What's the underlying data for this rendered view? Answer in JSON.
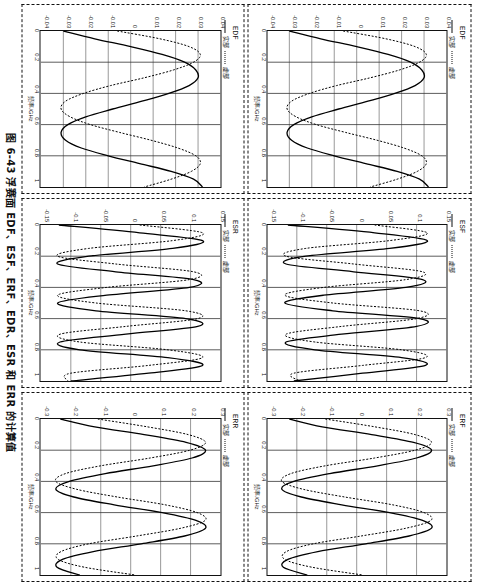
{
  "figure": {
    "caption": "图 6-43  浮赛面 EDF、ESF、ERF、EDR、ESR 和 ERR 的计算值"
  },
  "legend": {
    "real_label": "实部",
    "imag_label": "虚部"
  },
  "axis": {
    "xlabel": "频率/GHz",
    "xticks": [
      "0",
      "0.2",
      "0.4",
      "0.6",
      "0.8",
      "1"
    ]
  },
  "chart_data": [
    {
      "id": "edf",
      "type": "line",
      "title": "EDF",
      "xlabel": "频率/GHz",
      "ylabel": "",
      "xlim": [
        0,
        1
      ],
      "ylim": [
        -0.04,
        0.04
      ],
      "xticks": [
        "0",
        "0.2",
        "0.4",
        "0.6",
        "0.8",
        "1"
      ],
      "yticks": [
        "0.04",
        "0.03",
        "0.02",
        "0.01",
        "0",
        "-0.01",
        "-0.02",
        "-0.03",
        "-0.04"
      ],
      "grid": true,
      "legend_position": "top-left",
      "series": [
        {
          "name": "实部",
          "style": "solid",
          "x": [
            0,
            0.05,
            0.1,
            0.15,
            0.2,
            0.25,
            0.3,
            0.35,
            0.4,
            0.45,
            0.5,
            0.55,
            0.6,
            0.65,
            0.7,
            0.75,
            0.8,
            0.85,
            0.9,
            0.95,
            1
          ],
          "values": [
            -0.03,
            -0.016,
            0.0,
            0.014,
            0.024,
            0.029,
            0.03,
            0.026,
            0.017,
            0.005,
            -0.008,
            -0.02,
            -0.028,
            -0.031,
            -0.029,
            -0.022,
            -0.01,
            0.004,
            0.018,
            0.028,
            0.032
          ]
        },
        {
          "name": "虚部",
          "style": "dotted",
          "x": [
            0,
            0.05,
            0.1,
            0.15,
            0.2,
            0.25,
            0.3,
            0.35,
            0.4,
            0.45,
            0.5,
            0.55,
            0.6,
            0.65,
            0.7,
            0.75,
            0.8,
            0.85,
            0.9,
            0.95,
            1
          ],
          "values": [
            -0.006,
            0.013,
            0.026,
            0.031,
            0.028,
            0.019,
            0.006,
            -0.009,
            -0.021,
            -0.029,
            -0.031,
            -0.027,
            -0.018,
            -0.005,
            0.009,
            0.021,
            0.029,
            0.031,
            0.027,
            0.018,
            0.006
          ]
        }
      ]
    },
    {
      "id": "esf",
      "type": "line",
      "title": "ESF",
      "xlabel": "频率/GHz",
      "ylabel": "",
      "xlim": [
        0,
        1
      ],
      "ylim": [
        -0.15,
        0.15
      ],
      "xticks": [
        "0",
        "0.2",
        "0.4",
        "0.6",
        "0.8",
        "1"
      ],
      "yticks": [
        "0.15",
        "0.1",
        "0.05",
        "0",
        "-0.05",
        "-0.1",
        "-0.15"
      ],
      "grid": true,
      "legend_position": "top-left",
      "series": [
        {
          "name": "实部",
          "style": "solid",
          "periods": 5.2,
          "amplitude": 0.12,
          "phase": 200,
          "x": [
            0,
            0.05,
            0.1,
            0.15,
            0.2,
            0.25,
            0.3,
            0.35,
            0.4,
            0.45,
            0.5,
            0.55,
            0.6,
            0.65,
            0.7,
            0.75,
            0.8,
            0.85,
            0.9,
            0.95,
            1
          ],
          "values": [
            -0.115,
            0.03,
            0.118,
            0.055,
            -0.085,
            -0.118,
            -0.005,
            0.11,
            0.082,
            -0.055,
            -0.12,
            -0.04,
            0.105,
            0.1,
            -0.025,
            -0.118,
            -0.07,
            0.075,
            0.115,
            0.01,
            -0.105
          ]
        },
        {
          "name": "虚部",
          "style": "dotted",
          "periods": 5.2,
          "amplitude": 0.12,
          "phase": 290,
          "x": [
            0,
            0.05,
            0.1,
            0.15,
            0.2,
            0.25,
            0.3,
            0.35,
            0.4,
            0.45,
            0.5,
            0.55,
            0.6,
            0.65,
            0.7,
            0.75,
            0.8,
            0.85,
            0.9,
            0.95,
            1
          ],
          "values": [
            0.03,
            0.118,
            0.055,
            -0.085,
            -0.118,
            -0.005,
            0.11,
            0.082,
            -0.055,
            -0.12,
            -0.04,
            0.105,
            0.1,
            -0.025,
            -0.118,
            -0.07,
            0.075,
            0.115,
            0.01,
            -0.105,
            -0.095
          ]
        }
      ]
    },
    {
      "id": "erf",
      "type": "line",
      "title": "ERF",
      "xlabel": "频率/GHz",
      "ylabel": "",
      "xlim": [
        0,
        1
      ],
      "ylim": [
        -0.3,
        0.3
      ],
      "xticks": [
        "0",
        "0.2",
        "0.4",
        "0.6",
        "0.8",
        "1"
      ],
      "yticks": [
        "0.3",
        "0.2",
        "0.1",
        "0",
        "-0.1",
        "-0.2",
        "-0.3"
      ],
      "grid": true,
      "legend_position": "top-left",
      "series": [
        {
          "name": "实部",
          "style": "solid",
          "periods": 2.6,
          "amplitude": 0.25,
          "phase": 195,
          "x": [
            0,
            0.05,
            0.1,
            0.15,
            0.2,
            0.25,
            0.3,
            0.35,
            0.4,
            0.45,
            0.5,
            0.55,
            0.6,
            0.65,
            0.7,
            0.75,
            0.8,
            0.85,
            0.9,
            0.95,
            1
          ],
          "values": [
            -0.225,
            -0.115,
            0.05,
            0.19,
            0.25,
            0.2,
            0.07,
            -0.09,
            -0.21,
            -0.25,
            -0.185,
            -0.05,
            0.11,
            0.22,
            0.25,
            0.175,
            0.03,
            -0.13,
            -0.23,
            -0.245,
            -0.165
          ]
        },
        {
          "name": "虚部",
          "style": "dotted",
          "periods": 2.6,
          "amplitude": 0.25,
          "phase": 285,
          "x": [
            0,
            0.05,
            0.1,
            0.15,
            0.2,
            0.25,
            0.3,
            0.35,
            0.4,
            0.45,
            0.5,
            0.55,
            0.6,
            0.65,
            0.7,
            0.75,
            0.8,
            0.85,
            0.9,
            0.95,
            1
          ],
          "values": [
            -0.105,
            0.06,
            0.195,
            0.25,
            0.195,
            0.06,
            -0.105,
            -0.22,
            -0.25,
            -0.18,
            -0.04,
            0.12,
            0.225,
            0.248,
            0.165,
            0.015,
            -0.145,
            -0.235,
            -0.24,
            -0.15,
            0.02
          ]
        }
      ]
    },
    {
      "id": "edr",
      "type": "line",
      "title": "EDF",
      "xlabel": "频率/GHz",
      "ylabel": "",
      "xlim": [
        0,
        1
      ],
      "ylim": [
        -0.04,
        0.04
      ],
      "xticks": [
        "0",
        "0.2",
        "0.4",
        "0.6",
        "0.8",
        "1"
      ],
      "yticks": [
        "0.04",
        "0.03",
        "0.02",
        "0.01",
        "0",
        "-0.01",
        "-0.02",
        "-0.03",
        "-0.04"
      ],
      "grid": true,
      "legend_position": "top-left",
      "series": [
        {
          "name": "实部",
          "style": "solid",
          "x": [
            0,
            0.05,
            0.1,
            0.15,
            0.2,
            0.25,
            0.3,
            0.35,
            0.4,
            0.45,
            0.5,
            0.55,
            0.6,
            0.65,
            0.7,
            0.75,
            0.8,
            0.85,
            0.9,
            0.95,
            1
          ],
          "values": [
            -0.03,
            -0.016,
            0.0,
            0.014,
            0.024,
            0.029,
            0.03,
            0.026,
            0.017,
            0.005,
            -0.008,
            -0.02,
            -0.028,
            -0.031,
            -0.029,
            -0.022,
            -0.01,
            0.004,
            0.018,
            0.028,
            0.032
          ]
        },
        {
          "name": "虚部",
          "style": "dotted",
          "x": [
            0,
            0.05,
            0.1,
            0.15,
            0.2,
            0.25,
            0.3,
            0.35,
            0.4,
            0.45,
            0.5,
            0.55,
            0.6,
            0.65,
            0.7,
            0.75,
            0.8,
            0.85,
            0.9,
            0.95,
            1
          ],
          "values": [
            -0.006,
            0.013,
            0.026,
            0.031,
            0.028,
            0.019,
            0.006,
            -0.009,
            -0.021,
            -0.029,
            -0.031,
            -0.027,
            -0.018,
            -0.005,
            0.009,
            0.021,
            0.029,
            0.031,
            0.027,
            0.018,
            0.006
          ]
        }
      ]
    },
    {
      "id": "esr",
      "type": "line",
      "title": "ESR",
      "xlabel": "频率/GHz",
      "ylabel": "",
      "xlim": [
        0,
        1
      ],
      "ylim": [
        -0.15,
        0.15
      ],
      "xticks": [
        "0",
        "0.2",
        "0.4",
        "0.6",
        "0.8",
        "1"
      ],
      "yticks": [
        "0.15",
        "0.1",
        "0.05",
        "0",
        "-0.05",
        "-0.1",
        "-0.15"
      ],
      "grid": true,
      "legend_position": "top-left",
      "series": [
        {
          "name": "实部",
          "style": "solid",
          "periods": 5.2,
          "amplitude": 0.12,
          "phase": 185,
          "x": [
            0,
            0.05,
            0.1,
            0.15,
            0.2,
            0.25,
            0.3,
            0.35,
            0.4,
            0.45,
            0.5,
            0.55,
            0.6,
            0.65,
            0.7,
            0.75,
            0.8,
            0.85,
            0.9,
            0.95,
            1
          ],
          "values": [
            -0.12,
            0.015,
            0.12,
            0.07,
            -0.07,
            -0.122,
            -0.025,
            0.105,
            0.098,
            -0.04,
            -0.122,
            -0.058,
            0.092,
            0.112,
            -0.008,
            -0.118,
            -0.085,
            0.062,
            0.12,
            0.03,
            -0.1
          ]
        },
        {
          "name": "虚部",
          "style": "dotted",
          "periods": 5.2,
          "amplitude": 0.12,
          "phase": 275,
          "x": [
            0,
            0.05,
            0.1,
            0.15,
            0.2,
            0.25,
            0.3,
            0.35,
            0.4,
            0.45,
            0.5,
            0.55,
            0.6,
            0.65,
            0.7,
            0.75,
            0.8,
            0.85,
            0.9,
            0.95,
            1
          ],
          "values": [
            0.015,
            0.12,
            0.07,
            -0.07,
            -0.122,
            -0.025,
            0.105,
            0.098,
            -0.04,
            -0.122,
            -0.058,
            0.092,
            0.112,
            -0.008,
            -0.118,
            -0.085,
            0.062,
            0.12,
            0.03,
            -0.1,
            -0.105
          ]
        }
      ]
    },
    {
      "id": "err",
      "type": "line",
      "title": "ERR",
      "xlabel": "频率/GHz",
      "ylabel": "",
      "xlim": [
        0,
        1
      ],
      "ylim": [
        -0.3,
        0.3
      ],
      "xticks": [
        "0",
        "0.2",
        "0.4",
        "0.6",
        "0.8",
        "1"
      ],
      "yticks": [
        "0.3",
        "0.2",
        "0.1",
        "0",
        "-0.1",
        "-0.2",
        "-0.3"
      ],
      "grid": true,
      "legend_position": "top-left",
      "series": [
        {
          "name": "实部",
          "style": "solid",
          "periods": 2.6,
          "amplitude": 0.25,
          "phase": 190,
          "x": [
            0,
            0.05,
            0.1,
            0.15,
            0.2,
            0.25,
            0.3,
            0.35,
            0.4,
            0.45,
            0.5,
            0.55,
            0.6,
            0.65,
            0.7,
            0.75,
            0.8,
            0.85,
            0.9,
            0.95,
            1
          ],
          "values": [
            -0.235,
            -0.12,
            0.045,
            0.185,
            0.25,
            0.205,
            0.075,
            -0.085,
            -0.205,
            -0.25,
            -0.19,
            -0.055,
            0.105,
            0.218,
            0.25,
            0.18,
            0.035,
            -0.125,
            -0.228,
            -0.246,
            -0.17
          ]
        },
        {
          "name": "虚部",
          "style": "dotted",
          "periods": 2.6,
          "amplitude": 0.25,
          "phase": 280,
          "x": [
            0,
            0.05,
            0.1,
            0.15,
            0.2,
            0.25,
            0.3,
            0.35,
            0.4,
            0.45,
            0.5,
            0.55,
            0.6,
            0.65,
            0.7,
            0.75,
            0.8,
            0.85,
            0.9,
            0.95,
            1
          ],
          "values": [
            -0.11,
            0.055,
            0.192,
            0.25,
            0.198,
            0.065,
            -0.1,
            -0.218,
            -0.25,
            -0.182,
            -0.045,
            0.115,
            0.222,
            0.249,
            0.168,
            0.02,
            -0.14,
            -0.233,
            -0.242,
            -0.155,
            0.015
          ]
        }
      ]
    }
  ]
}
